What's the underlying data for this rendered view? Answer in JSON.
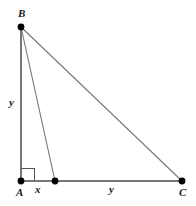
{
  "figure": {
    "kind": "right-triangle-with-cevian",
    "canvas": {
      "width": 196,
      "height": 206,
      "background": "#ffffff"
    },
    "style": {
      "line_color": "#777777",
      "line_width": 1,
      "dot_color": "#000000",
      "dot_radius": 3.2,
      "label_color": "#1a1a1a",
      "right_angle_color": "#555555"
    },
    "points": [
      {
        "id": "B",
        "label": "B",
        "x": 21,
        "y": 27,
        "dot": true
      },
      {
        "id": "A",
        "label": "A",
        "x": 21,
        "y": 181,
        "dot": true
      },
      {
        "id": "D",
        "label": "",
        "x": 55,
        "y": 181,
        "dot": true
      },
      {
        "id": "C",
        "label": "C",
        "x": 182,
        "y": 181,
        "dot": true
      }
    ],
    "segments": [
      {
        "id": "BA",
        "from": "B",
        "to": "A"
      },
      {
        "id": "BD",
        "from": "B",
        "to": "D"
      },
      {
        "id": "BC",
        "from": "B",
        "to": "C"
      },
      {
        "id": "AC",
        "from": "A",
        "to": "C"
      }
    ],
    "right_angle": {
      "at": "A",
      "size": 12,
      "corner_x": 21,
      "corner_y": 181
    },
    "labels": {
      "vertex_B": "B",
      "vertex_A": "A",
      "vertex_C": "C",
      "leg_BA": "y",
      "segment_AD": "x",
      "segment_DC": "y"
    }
  }
}
